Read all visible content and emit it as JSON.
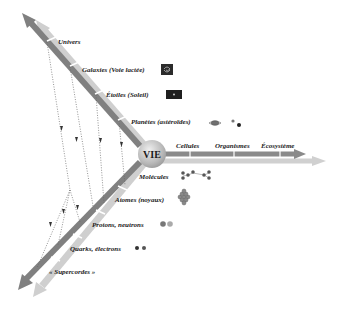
{
  "center": {
    "label": "VIE"
  },
  "upper_axis": {
    "direction": "toward the very large",
    "levels": [
      {
        "label": "Univers",
        "icon": "none"
      },
      {
        "label": "Galaxies (Voie lactée)",
        "icon": "galaxy-icon"
      },
      {
        "label": "Étoiles (Soleil)",
        "icon": "star-icon"
      },
      {
        "label": "Planètes (astéroïdes)",
        "icon": "planet-asteroids-icon"
      }
    ]
  },
  "lower_axis": {
    "direction": "toward the very small",
    "levels": [
      {
        "label": "Molécules",
        "icon": "molecule-icon"
      },
      {
        "label": "Atomes (noyaux)",
        "icon": "atom-nucleus-icon"
      },
      {
        "label": "Protons, neutrons",
        "icon": "proton-neutron-icon"
      },
      {
        "label": "Quarks, électrons",
        "icon": "quark-electron-icon"
      },
      {
        "label": "« Supercordes »",
        "icon": "none"
      }
    ]
  },
  "right_axis": {
    "direction": "toward complexity",
    "levels": [
      {
        "label": "Cellules"
      },
      {
        "label": "Organismes"
      },
      {
        "label": "Écosystème"
      }
    ]
  },
  "colors": {
    "dark_arrow": "#7a7a7a",
    "light_arrow": "#c8c8c8",
    "circle": "#bdbdbd",
    "text": "#222222",
    "dotted": "#666666"
  }
}
